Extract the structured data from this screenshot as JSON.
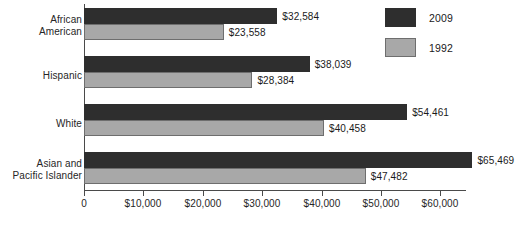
{
  "chart_data": {
    "type": "bar",
    "orientation": "horizontal",
    "title": "",
    "xlabel": "",
    "ylabel": "",
    "grid": false,
    "legend_position": "top-right",
    "categories": [
      "African American",
      "Hispanic",
      "White",
      "Asian and Pacific Islander"
    ],
    "xlim": [
      0,
      70000
    ],
    "xticks": [
      0,
      10000,
      20000,
      30000,
      40000,
      50000,
      60000
    ],
    "xtick_labels": [
      "0",
      "$10,000",
      "$20,000",
      "$30,000",
      "$40,000",
      "$50,000",
      "$60,000"
    ],
    "series": [
      {
        "name": "2009",
        "color": "#2e2e2e",
        "values": [
          32584,
          38039,
          54461,
          65469
        ],
        "labels": [
          "$32,584",
          "$38,039",
          "$54,461",
          "$65,469"
        ]
      },
      {
        "name": "1992",
        "color": "#a8a8a8",
        "values": [
          23558,
          28384,
          40458,
          47482
        ],
        "labels": [
          "$23,558",
          "$28,384",
          "$40,458",
          "$47,482"
        ]
      }
    ]
  },
  "category_labels": [
    "African\nAmerican",
    "Hispanic",
    "White",
    "Asian and\nPacific Islander"
  ],
  "legend": {
    "items": [
      {
        "label": "2009",
        "color": "#2e2e2e"
      },
      {
        "label": "1992",
        "color": "#a8a8a8"
      }
    ]
  },
  "axis": {
    "tick_labels": [
      "0",
      "$10,000",
      "$20,000",
      "$30,000",
      "$40,000",
      "$50,000",
      "$60,000"
    ]
  },
  "values": {
    "g0s0": "$32,584",
    "g0s1": "$23,558",
    "g1s0": "$38,039",
    "g1s1": "$28,384",
    "g2s0": "$54,461",
    "g2s1": "$40,458",
    "g3s0": "$65,469",
    "g3s1": "$47,482"
  }
}
